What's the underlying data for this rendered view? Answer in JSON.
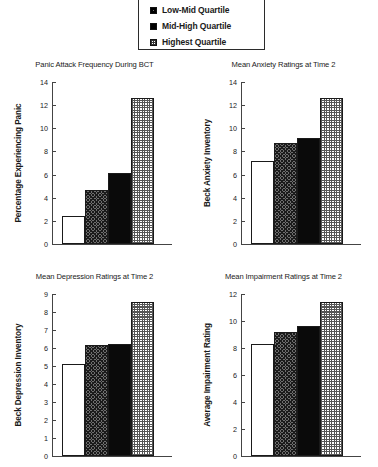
{
  "legend": {
    "name": "quartile-legend",
    "items": [
      {
        "label": "Low-Mid Quartile",
        "pattern": "hatch"
      },
      {
        "label": "Mid-High Quartile",
        "pattern": "solid"
      },
      {
        "label": "Highest Quartile",
        "pattern": "dots"
      }
    ]
  },
  "chart_data": [
    {
      "id": "panic-frequency",
      "type": "bar",
      "title": "Panic Attack Frequency During BCT",
      "xlabel": "",
      "ylabel": "Percentage Experiencing Panic",
      "categories": [
        "Lowest Quartile",
        "Low-Mid Quartile",
        "Mid-High Quartile",
        "Highest Quartile"
      ],
      "patterns": [
        "white",
        "hatch",
        "solid",
        "dots"
      ],
      "values": [
        2.4,
        4.7,
        6.1,
        12.6
      ],
      "ylim": [
        0,
        14
      ],
      "yticks": [
        0,
        2,
        4,
        6,
        8,
        10,
        12,
        14
      ],
      "grid": false,
      "legend_position": "top-center"
    },
    {
      "id": "anxiety-ratings",
      "type": "bar",
      "title": "Mean Anxiety Ratings at Time 2",
      "xlabel": "",
      "ylabel": "Beck Anxiety Inventory",
      "categories": [
        "Lowest Quartile",
        "Low-Mid Quartile",
        "Mid-High Quartile",
        "Highest Quartile"
      ],
      "patterns": [
        "white",
        "hatch",
        "solid",
        "dots"
      ],
      "values": [
        7.2,
        8.7,
        9.2,
        12.6
      ],
      "ylim": [
        0,
        14
      ],
      "yticks": [
        0,
        2,
        4,
        6,
        8,
        10,
        12,
        14
      ],
      "grid": false,
      "legend_position": "top-center"
    },
    {
      "id": "depression-ratings",
      "type": "bar",
      "title": "Mean Depression Ratings at Time 2",
      "xlabel": "",
      "ylabel": "Beck Depression Inventory",
      "categories": [
        "Lowest Quartile",
        "Low-Mid Quartile",
        "Mid-High Quartile",
        "Highest Quartile"
      ],
      "patterns": [
        "white",
        "hatch",
        "solid",
        "dots"
      ],
      "values": [
        5.1,
        6.15,
        6.25,
        8.55
      ],
      "ylim": [
        0,
        9
      ],
      "yticks": [
        0,
        1,
        2,
        3,
        4,
        5,
        6,
        7,
        8,
        9
      ],
      "grid": false,
      "legend_position": "top-center"
    },
    {
      "id": "impairment-ratings",
      "type": "bar",
      "title": "Mean Impairment Ratings at Time 2",
      "xlabel": "",
      "ylabel": "Average Impairment Rating",
      "categories": [
        "Lowest Quartile",
        "Low-Mid Quartile",
        "Mid-High Quartile",
        "Highest Quartile"
      ],
      "patterns": [
        "white",
        "hatch",
        "solid",
        "dots"
      ],
      "values": [
        8.3,
        9.15,
        9.65,
        11.4
      ],
      "ylim": [
        0,
        12
      ],
      "yticks": [
        0,
        2,
        4,
        6,
        8,
        10,
        12
      ],
      "grid": false,
      "legend_position": "top-center"
    }
  ]
}
